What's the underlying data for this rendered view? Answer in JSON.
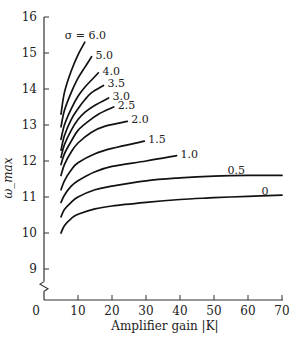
{
  "chart_data": {
    "type": "line",
    "title": "",
    "xlabel": "Amplifier gain |K|",
    "ylabel": "ω_max",
    "xlim": [
      0,
      70
    ],
    "ylim": [
      8.5,
      16
    ],
    "x_ticks": [
      0,
      10,
      20,
      30,
      40,
      50,
      60,
      70
    ],
    "y_ticks": [
      9,
      10,
      11,
      12,
      13,
      14,
      15,
      16
    ],
    "grid": false,
    "legend": "inline curve labels",
    "axis_break": "y-axis break below 9",
    "series": [
      {
        "name": "σ = 6.0",
        "label": "σ = 6.0",
        "x": [
          5,
          6,
          8,
          10,
          12
        ],
        "y": [
          13.3,
          13.9,
          14.5,
          14.95,
          15.3
        ]
      },
      {
        "name": "σ = 5.0",
        "label": "5.0",
        "x": [
          5,
          6,
          8,
          10,
          12,
          14
        ],
        "y": [
          12.95,
          13.4,
          13.9,
          14.3,
          14.6,
          14.9
        ]
      },
      {
        "name": "σ = 4.0",
        "label": "4.0",
        "x": [
          5,
          6,
          8,
          10,
          12,
          14,
          16
        ],
        "y": [
          12.6,
          13.0,
          13.45,
          13.8,
          14.05,
          14.25,
          14.45
        ]
      },
      {
        "name": "σ = 3.5",
        "label": "3.5",
        "x": [
          5,
          6,
          8,
          10,
          12,
          14,
          17.5
        ],
        "y": [
          12.3,
          12.7,
          13.15,
          13.45,
          13.7,
          13.9,
          14.1
        ]
      },
      {
        "name": "σ = 3.0",
        "label": "3.0",
        "x": [
          5,
          6,
          8,
          10,
          12,
          15,
          19
        ],
        "y": [
          12.1,
          12.45,
          12.85,
          13.15,
          13.35,
          13.55,
          13.75
        ]
      },
      {
        "name": "σ = 2.5",
        "label": "2.5",
        "x": [
          5,
          6,
          8,
          10,
          13,
          16,
          20.5
        ],
        "y": [
          11.9,
          12.2,
          12.55,
          12.85,
          13.1,
          13.3,
          13.5
        ]
      },
      {
        "name": "σ = 2.0",
        "label": "2.0",
        "x": [
          5,
          6,
          8,
          10,
          14,
          18,
          24.5
        ],
        "y": [
          11.6,
          11.9,
          12.25,
          12.5,
          12.8,
          12.97,
          13.1
        ]
      },
      {
        "name": "σ = 1.5",
        "label": "1.5",
        "x": [
          5,
          6,
          8,
          10,
          15,
          20,
          29.5
        ],
        "y": [
          11.2,
          11.45,
          11.75,
          11.95,
          12.2,
          12.35,
          12.55
        ]
      },
      {
        "name": "σ = 1.0",
        "label": "1.0",
        "x": [
          5,
          6,
          8,
          10,
          15,
          20,
          30,
          39
        ],
        "y": [
          10.85,
          11.05,
          11.3,
          11.45,
          11.7,
          11.85,
          12.0,
          12.15
        ]
      },
      {
        "name": "σ = 0.5",
        "label": "0.5",
        "x": [
          5,
          6,
          8,
          10,
          15,
          20,
          30,
          40,
          50,
          60,
          70
        ],
        "y": [
          10.45,
          10.65,
          10.85,
          11.0,
          11.2,
          11.3,
          11.45,
          11.53,
          11.58,
          11.6,
          11.6
        ]
      },
      {
        "name": "σ = 0",
        "label": "0",
        "x": [
          5,
          6,
          8,
          10,
          15,
          20,
          30,
          40,
          50,
          60,
          70
        ],
        "y": [
          10.0,
          10.2,
          10.4,
          10.52,
          10.67,
          10.75,
          10.85,
          10.93,
          10.98,
          11.02,
          11.05
        ]
      }
    ]
  }
}
